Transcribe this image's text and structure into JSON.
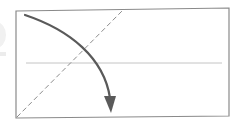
{
  "diagram": {
    "type": "origami-fold-step",
    "colors": {
      "background": "#ffffff",
      "paper_border": "#8a8a8a",
      "center_crease": "#c4c4c4",
      "fold_line": "#8c8c8c",
      "arrow": "#5a5a5a"
    },
    "paper": {
      "shape": "rectangle",
      "corners": [
        [
          16,
          11
        ],
        [
          229,
          8
        ],
        [
          229,
          116
        ],
        [
          16,
          118
        ]
      ]
    },
    "center_crease": {
      "from": [
        26,
        63
      ],
      "to": [
        222,
        63
      ]
    },
    "fold_line": {
      "style": "dashed",
      "kind": "valley",
      "from": [
        17,
        117
      ],
      "to": [
        124,
        9
      ]
    },
    "arrow": {
      "kind": "fold-direction",
      "start": [
        25,
        15
      ],
      "end": [
        111,
        112
      ]
    }
  }
}
